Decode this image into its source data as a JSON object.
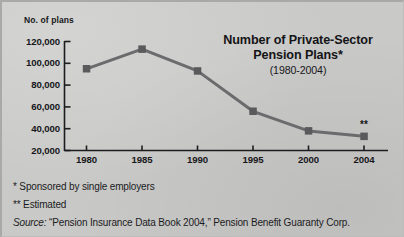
{
  "figure": {
    "background_color": "#c9c9c7",
    "ink_color": "#17171a"
  },
  "axis_title": "No. of plans",
  "chart_data": {
    "type": "line",
    "title": "Number of Private-Sector Pension Plans*",
    "subtitle": "(1980-2004)",
    "xlabel": "",
    "ylabel": "No. of plans",
    "categories": [
      "1980",
      "1985",
      "1990",
      "1995",
      "2000",
      "2004"
    ],
    "x": [
      1980,
      1985,
      1990,
      1995,
      2000,
      2004
    ],
    "values": [
      95000,
      113000,
      93000,
      56000,
      38000,
      33000
    ],
    "series": [
      {
        "name": "Number of private-sector pension plans",
        "values": [
          95000,
          113000,
          93000,
          56000,
          38000,
          33000
        ]
      }
    ],
    "point_annotations": [
      {
        "category": "2004",
        "label": "**"
      }
    ],
    "ylim": [
      20000,
      120000
    ],
    "ytick_values": [
      120000,
      100000,
      80000,
      60000,
      40000,
      20000
    ],
    "ytick_labels": [
      "120,000",
      "100,000",
      "80,000",
      "60,000",
      "40,000",
      "20,000"
    ],
    "xtick_labels": [
      "1980",
      "1985",
      "1990",
      "1995",
      "2000",
      "2004"
    ],
    "grid": false,
    "legend": false,
    "line_color": "#6b6b6e",
    "marker": "square",
    "marker_color": "#5a5a5d"
  },
  "notes": [
    {
      "text": "* Sponsored by single employers"
    },
    {
      "text": "** Estimated"
    }
  ],
  "source": {
    "lead": "Source:",
    "text": " “Pension Insurance Data Book 2004,” Pension Benefit Guaranty Corp."
  }
}
